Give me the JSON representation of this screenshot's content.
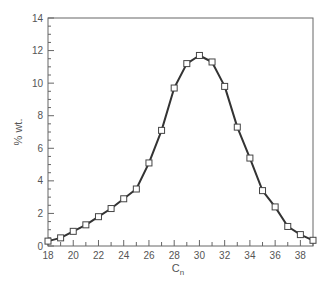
{
  "chart_data": {
    "type": "line",
    "title": "",
    "xlabel": "C",
    "xlabel_subscript": "n",
    "ylabel": "% wt.",
    "xlim": [
      18,
      39
    ],
    "ylim": [
      0,
      14
    ],
    "x_major_ticks": [
      18,
      20,
      22,
      24,
      26,
      28,
      30,
      32,
      34,
      36,
      38
    ],
    "y_major_ticks": [
      0,
      2,
      4,
      6,
      8,
      10,
      12,
      14
    ],
    "grid": false,
    "legend": null,
    "marker": "open-square",
    "line_color": "#333333",
    "x": [
      18,
      19,
      20,
      21,
      22,
      23,
      24,
      25,
      26,
      27,
      28,
      29,
      30,
      31,
      32,
      33,
      34,
      35,
      36,
      37,
      38,
      39
    ],
    "series": [
      {
        "name": "% wt.",
        "values": [
          0.3,
          0.5,
          0.9,
          1.3,
          1.8,
          2.3,
          2.9,
          3.5,
          5.1,
          7.1,
          9.7,
          11.2,
          11.7,
          11.3,
          9.8,
          7.3,
          5.4,
          3.4,
          2.4,
          1.2,
          0.7,
          0.35
        ]
      }
    ]
  }
}
